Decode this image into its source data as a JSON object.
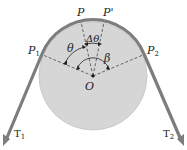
{
  "figure": {
    "type": "belt-friction-diagram",
    "labels": {
      "p": "P",
      "p_prime": "P'",
      "p1": "P",
      "p1_sub": "1",
      "p2": "P",
      "p2_sub": "2",
      "theta": "θ",
      "delta_theta": "Δθ",
      "beta": "β",
      "origin": "O",
      "t1": "T",
      "t1_sub": "1",
      "t2": "T",
      "t2_sub": "2"
    },
    "colors": {
      "disk_fill": "#d6d6d6",
      "disk_stroke": "#b8b8b8",
      "belt": "#7d7d7d",
      "lines": "#333333",
      "background": "#ffffff"
    }
  }
}
